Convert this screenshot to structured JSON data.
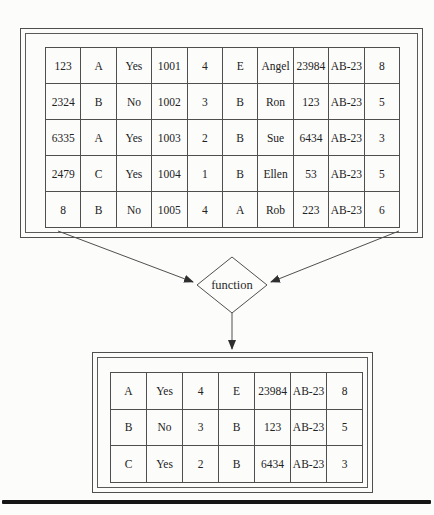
{
  "figure": {
    "source_table": {
      "rows": [
        [
          "123",
          "A",
          "Yes",
          "1001",
          "4",
          "E",
          "Angel",
          "23984",
          "AB-23",
          "8"
        ],
        [
          "2324",
          "B",
          "No",
          "1002",
          "3",
          "B",
          "Ron",
          "123",
          "AB-23",
          "5"
        ],
        [
          "6335",
          "A",
          "Yes",
          "1003",
          "2",
          "B",
          "Sue",
          "6434",
          "AB-23",
          "3"
        ],
        [
          "2479",
          "C",
          "Yes",
          "1004",
          "1",
          "B",
          "Ellen",
          "53",
          "AB-23",
          "5"
        ],
        [
          "8",
          "B",
          "No",
          "1005",
          "4",
          "A",
          "Rob",
          "223",
          "AB-23",
          "6"
        ]
      ]
    },
    "function_node": {
      "label": "function"
    },
    "result_table": {
      "rows": [
        [
          "A",
          "Yes",
          "4",
          "E",
          "23984",
          "AB-23",
          "8"
        ],
        [
          "B",
          "No",
          "3",
          "B",
          "123",
          "AB-23",
          "5"
        ],
        [
          "C",
          "Yes",
          "2",
          "B",
          "6434",
          "AB-23",
          "3"
        ]
      ]
    },
    "colors": {
      "line": "#4f4f4f",
      "arrowhead": "#2f2f2f",
      "text": "#222222",
      "background": "#fcfcfb",
      "bottom_rule": "#151515"
    }
  }
}
